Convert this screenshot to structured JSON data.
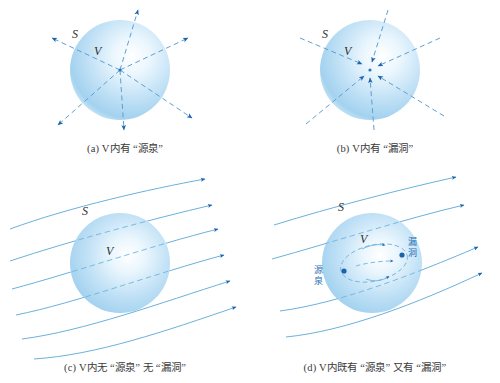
{
  "figure": {
    "title": "",
    "colors": {
      "sphere_edge": "#a8d3ef",
      "sphere_center": "#ffffff",
      "sphere_rim": "#7fc0e8",
      "arrow_blue": "#1c63ad",
      "line_blue": "#5aa7d8",
      "dash_blue": "#6fb4de",
      "caption_text": "#3a3a3a",
      "label_text": "#2e2e2e",
      "inner_label": "#1f6fb5"
    }
  },
  "panels": [
    {
      "id": "a",
      "caption": "(a) V内有 “源泉”",
      "surface_label": "S",
      "volume_label": "V",
      "flow": "outward",
      "ray_count": 6,
      "inner_labels": []
    },
    {
      "id": "b",
      "caption": "(b) V内有 “漏洞”",
      "surface_label": "S",
      "volume_label": "V",
      "flow": "inward",
      "ray_count": 6,
      "inner_labels": []
    },
    {
      "id": "c",
      "caption": "(c) V内无 “源泉” 无 “漏洞”",
      "surface_label": "S",
      "volume_label": "V",
      "flow": "through",
      "line_count": 6,
      "inner_labels": []
    },
    {
      "id": "d",
      "caption": "(d) V内既有 “源泉” 又有 “漏洞”",
      "surface_label": "S",
      "volume_label": "V",
      "flow": "through-with-dipole",
      "line_count": 5,
      "inner_labels": [
        {
          "name": "source",
          "text": "源\n泉",
          "line1": "源",
          "line2": "泉"
        },
        {
          "name": "sink",
          "text": "漏\n洞",
          "line1": "漏",
          "line2": "洞"
        }
      ]
    }
  ]
}
